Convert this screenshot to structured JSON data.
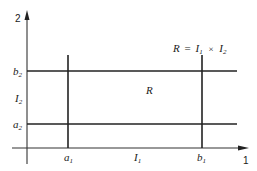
{
  "diagram": {
    "title": "R = I1 × I2",
    "formula": {
      "R": "R",
      "eq": "=",
      "I": "I",
      "sub1": "1",
      "times": "×",
      "sub2": "2"
    },
    "axes": {
      "x_label": "1",
      "y_label": "2"
    },
    "region_label": "R",
    "ticks": {
      "a1": {
        "base": "a",
        "sub": "1"
      },
      "b1": {
        "base": "b",
        "sub": "1"
      },
      "a2": {
        "base": "a",
        "sub": "2"
      },
      "b2": {
        "base": "b",
        "sub": "2"
      }
    },
    "intervals": {
      "I1": {
        "base": "I",
        "sub": "1"
      },
      "I2": {
        "base": "I",
        "sub": "2"
      }
    },
    "colors": {
      "line": "#222222",
      "background": "#ffffff"
    }
  }
}
